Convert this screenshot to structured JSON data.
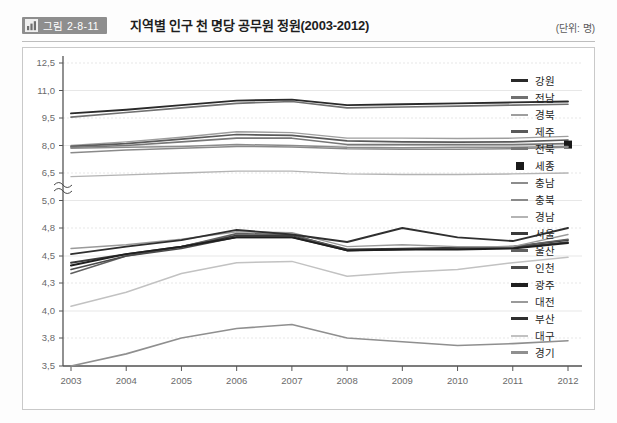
{
  "header": {
    "badge_icon": "bar-chart-icon",
    "badge_text": "그림 2-8-11",
    "title": "지역별 인구 천 명당 공무원 정원(2003-2012)",
    "unit": "(단위: 명)"
  },
  "chart_data": {
    "type": "line",
    "title": "지역별 인구 천 명당 공무원 정원(2003-2012)",
    "xlabel": "",
    "ylabel": "",
    "unit": "명",
    "grid": true,
    "legend_position": "right",
    "axis_break": {
      "between": [
        5.0,
        6.5
      ],
      "note": "broken y-axis between 5.0 and 6.5"
    },
    "x": [
      "2003",
      "2004",
      "2005",
      "2006",
      "2007",
      "2008",
      "2009",
      "2010",
      "2011",
      "2012"
    ],
    "yticks_upper": [
      "12,5",
      "11,0",
      "9,5",
      "8,0",
      "6,5",
      "5,0"
    ],
    "yticks_lower": [
      "4,8",
      "4,5",
      "4,3",
      "4,0",
      "3,8",
      "3,5"
    ],
    "yticks_upper_values": [
      12.5,
      11.0,
      9.5,
      8.0,
      6.5,
      5.0
    ],
    "yticks_lower_values": [
      4.8,
      4.5,
      4.3,
      4.0,
      3.8,
      3.5
    ],
    "series": [
      {
        "name": "강원",
        "color": "#2a2a2a",
        "width": 1.9,
        "values": [
          9.75,
          9.95,
          10.2,
          10.45,
          10.5,
          10.2,
          10.25,
          10.3,
          10.35,
          10.4
        ]
      },
      {
        "name": "전남",
        "color": "#707070",
        "width": 1.7,
        "values": [
          9.55,
          9.8,
          10.05,
          10.3,
          10.4,
          10.05,
          10.1,
          10.15,
          10.2,
          10.25
        ]
      },
      {
        "name": "경북",
        "color": "#9e9e9e",
        "width": 1.4,
        "values": [
          8.0,
          8.2,
          8.45,
          8.75,
          8.7,
          8.4,
          8.4,
          8.38,
          8.4,
          8.5
        ]
      },
      {
        "name": "제주",
        "color": "#5a5a5a",
        "width": 1.7,
        "values": [
          7.95,
          8.1,
          8.35,
          8.6,
          8.55,
          8.25,
          8.2,
          8.18,
          8.2,
          8.3
        ]
      },
      {
        "name": "전북",
        "color": "#777777",
        "width": 1.6,
        "values": [
          7.9,
          8.0,
          8.2,
          8.4,
          8.4,
          8.05,
          8.05,
          8.05,
          8.05,
          8.1
        ]
      },
      {
        "name": "세종",
        "color": "#1a1a1a",
        "width": 0,
        "marker": "square",
        "values": [
          null,
          null,
          null,
          null,
          null,
          null,
          null,
          null,
          null,
          8.05
        ]
      },
      {
        "name": "충남",
        "color": "#8c8c8c",
        "width": 1.5,
        "values": [
          7.85,
          7.9,
          7.95,
          8.05,
          8.0,
          7.9,
          7.88,
          7.9,
          7.9,
          7.95
        ]
      },
      {
        "name": "충북",
        "color": "#8a8a8a",
        "width": 1.5,
        "values": [
          7.6,
          7.75,
          7.85,
          7.95,
          7.92,
          7.82,
          7.8,
          7.8,
          7.82,
          7.9
        ]
      },
      {
        "name": "경남",
        "color": "#b4b4b4",
        "width": 1.4,
        "values": [
          6.3,
          6.4,
          6.5,
          6.6,
          6.6,
          6.45,
          6.42,
          6.42,
          6.45,
          6.5
        ]
      },
      {
        "name": "서울",
        "color": "#3a3a3a",
        "width": 1.8,
        "values": [
          4.45,
          4.52,
          4.6,
          4.72,
          4.72,
          4.57,
          4.58,
          4.59,
          4.6,
          4.67
        ]
      },
      {
        "name": "울산",
        "color": "#606060",
        "width": 1.6,
        "values": [
          4.37,
          4.5,
          4.6,
          4.74,
          4.73,
          4.56,
          4.57,
          4.58,
          4.6,
          4.68
        ]
      },
      {
        "name": "인천",
        "color": "#4a4a4a",
        "width": 1.6,
        "values": [
          4.4,
          4.5,
          4.58,
          4.7,
          4.7,
          4.56,
          4.57,
          4.58,
          4.59,
          4.65
        ]
      },
      {
        "name": "광주",
        "color": "#1f1f1f",
        "width": 2.0,
        "values": [
          4.43,
          4.52,
          4.6,
          4.7,
          4.7,
          4.56,
          4.57,
          4.57,
          4.58,
          4.64
        ]
      },
      {
        "name": "대전",
        "color": "#9a9a9a",
        "width": 1.4,
        "values": [
          4.58,
          4.62,
          4.68,
          4.76,
          4.75,
          4.6,
          4.62,
          4.6,
          4.6,
          4.73
        ]
      },
      {
        "name": "부산",
        "color": "#2f2f2f",
        "width": 1.9,
        "values": [
          4.52,
          4.6,
          4.67,
          4.78,
          4.73,
          4.65,
          4.8,
          4.7,
          4.66,
          4.8
        ]
      },
      {
        "name": "대구",
        "color": "#c2c2c2",
        "width": 1.5,
        "values": [
          4.05,
          4.2,
          4.37,
          4.45,
          4.46,
          4.35,
          4.38,
          4.4,
          4.45,
          4.49
        ]
      },
      {
        "name": "경기",
        "color": "#8f8f8f",
        "width": 1.6,
        "values": [
          3.5,
          3.63,
          3.8,
          3.87,
          3.9,
          3.8,
          3.76,
          3.72,
          3.74,
          3.77
        ]
      }
    ]
  },
  "legend": {
    "items": [
      {
        "label": "강원",
        "color": "#2a2a2a",
        "type": "line",
        "width": 3
      },
      {
        "label": "전남",
        "color": "#707070",
        "type": "line",
        "width": 3
      },
      {
        "label": "경북",
        "color": "#9e9e9e",
        "type": "line",
        "width": 2
      },
      {
        "label": "제주",
        "color": "#5a5a5a",
        "type": "line",
        "width": 3
      },
      {
        "label": "전북",
        "color": "#777777",
        "type": "line",
        "width": 3
      },
      {
        "label": "세종",
        "color": "#1a1a1a",
        "type": "marker",
        "width": 0
      },
      {
        "label": "충남",
        "color": "#8c8c8c",
        "type": "line",
        "width": 2
      },
      {
        "label": "충북",
        "color": "#8a8a8a",
        "type": "line",
        "width": 2
      },
      {
        "label": "경남",
        "color": "#b4b4b4",
        "type": "line",
        "width": 2
      },
      {
        "label": "서울",
        "color": "#3a3a3a",
        "type": "line",
        "width": 3
      },
      {
        "label": "울산",
        "color": "#606060",
        "type": "line",
        "width": 3
      },
      {
        "label": "인천",
        "color": "#4a4a4a",
        "type": "line",
        "width": 3
      },
      {
        "label": "광주",
        "color": "#1f1f1f",
        "type": "line",
        "width": 4
      },
      {
        "label": "대전",
        "color": "#9a9a9a",
        "type": "line",
        "width": 2
      },
      {
        "label": "부산",
        "color": "#2f2f2f",
        "type": "line",
        "width": 3
      },
      {
        "label": "대구",
        "color": "#c2c2c2",
        "type": "line",
        "width": 2
      },
      {
        "label": "경기",
        "color": "#8f8f8f",
        "type": "line",
        "width": 3
      }
    ]
  }
}
